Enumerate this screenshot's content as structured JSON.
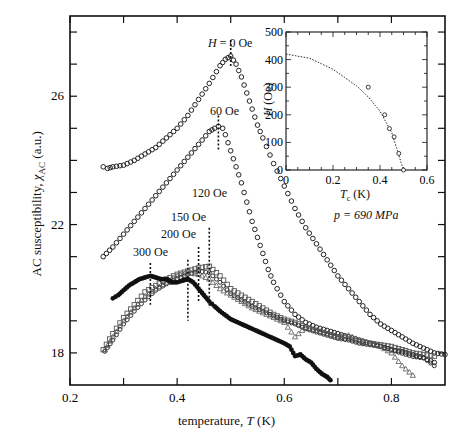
{
  "chart_data": [
    {
      "type": "scatter",
      "title": "",
      "xlabel": "temperature, T (K)",
      "ylabel": "AC susceptibility, χ_AC (a.u.)",
      "xlim": [
        0.2,
        0.9
      ],
      "ylim": [
        17.0,
        28.5
      ],
      "xticks": [
        0.2,
        0.4,
        0.6,
        0.8
      ],
      "xticks_minor": [
        0.3,
        0.5,
        0.7
      ],
      "yticks": [
        18,
        22,
        26
      ],
      "yticks_minor": [
        19,
        20,
        21,
        23,
        24,
        25,
        27,
        28
      ],
      "grid": false,
      "annotations": [
        {
          "text": "H = 0 Oe",
          "x": 0.5,
          "y": 27.25
        },
        {
          "text": "60 Oe",
          "x": 0.477,
          "y": 25.06
        },
        {
          "text": "120 Oe",
          "x": 0.46,
          "y": 20.6
        },
        {
          "text": "150 Oe",
          "x": 0.44,
          "y": 20.6
        },
        {
          "text": "200 Oe",
          "x": 0.42,
          "y": 20.5
        },
        {
          "text": "300 Oe",
          "x": 0.35,
          "y": 20.4
        }
      ],
      "series": [
        {
          "name": "H = 0 Oe",
          "marker": "open-circle",
          "x": [
            0.262,
            0.27,
            0.28,
            0.3,
            0.32,
            0.34,
            0.36,
            0.38,
            0.4,
            0.42,
            0.44,
            0.46,
            0.48,
            0.49,
            0.5,
            0.51,
            0.52,
            0.53,
            0.54,
            0.55,
            0.56,
            0.58,
            0.6,
            0.62,
            0.64,
            0.66,
            0.68,
            0.7,
            0.72,
            0.74,
            0.76,
            0.78,
            0.8,
            0.82,
            0.84,
            0.86,
            0.88,
            0.9
          ],
          "y": [
            23.8,
            23.75,
            23.8,
            23.85,
            24.0,
            24.2,
            24.4,
            24.7,
            25.0,
            25.4,
            25.9,
            26.4,
            26.95,
            27.15,
            27.25,
            27.0,
            26.6,
            26.1,
            25.6,
            25.1,
            24.7,
            23.9,
            23.2,
            22.5,
            21.9,
            21.4,
            20.9,
            20.4,
            20.0,
            19.6,
            19.2,
            18.9,
            18.7,
            18.5,
            18.3,
            18.15,
            18.0,
            17.95
          ]
        },
        {
          "name": "60 Oe",
          "marker": "open-circle",
          "x": [
            0.262,
            0.28,
            0.3,
            0.32,
            0.34,
            0.36,
            0.38,
            0.4,
            0.42,
            0.44,
            0.46,
            0.47,
            0.477,
            0.485,
            0.49,
            0.5,
            0.51,
            0.52,
            0.53,
            0.54,
            0.55,
            0.56,
            0.57,
            0.58,
            0.6,
            0.62,
            0.64,
            0.66,
            0.68,
            0.7,
            0.72,
            0.74,
            0.76,
            0.78,
            0.8,
            0.82,
            0.84,
            0.86,
            0.88
          ],
          "y": [
            21.0,
            21.3,
            21.7,
            22.1,
            22.5,
            22.9,
            23.3,
            23.7,
            24.1,
            24.5,
            24.9,
            25.0,
            25.06,
            25.0,
            24.8,
            24.3,
            23.8,
            23.3,
            22.7,
            22.1,
            21.6,
            21.1,
            20.6,
            20.2,
            19.6,
            19.2,
            18.95,
            18.8,
            18.7,
            18.6,
            18.5,
            18.4,
            18.3,
            18.2,
            18.1,
            18.0,
            17.9,
            17.85,
            17.7
          ]
        },
        {
          "name": "120 Oe",
          "marker": "open-square",
          "x": [
            0.262,
            0.28,
            0.3,
            0.32,
            0.34,
            0.36,
            0.38,
            0.4,
            0.42,
            0.44,
            0.46,
            0.48,
            0.5,
            0.52,
            0.54,
            0.56,
            0.58,
            0.6,
            0.62,
            0.64,
            0.66,
            0.68,
            0.7,
            0.72,
            0.74,
            0.76,
            0.78,
            0.8,
            0.82,
            0.84,
            0.86,
            0.88
          ],
          "y": [
            18.1,
            18.6,
            19.1,
            19.5,
            19.9,
            20.1,
            20.3,
            20.45,
            20.55,
            20.65,
            20.7,
            20.4,
            20.0,
            19.8,
            19.6,
            19.4,
            19.2,
            19.05,
            18.95,
            18.8,
            18.7,
            18.6,
            18.5,
            18.45,
            18.35,
            18.3,
            18.25,
            18.2,
            18.1,
            18.0,
            17.95,
            17.9
          ]
        },
        {
          "name": "150 Oe",
          "marker": "open-circle-small",
          "x": [
            0.265,
            0.28,
            0.3,
            0.32,
            0.34,
            0.36,
            0.38,
            0.4,
            0.42,
            0.44,
            0.46,
            0.48,
            0.5,
            0.52,
            0.54,
            0.56,
            0.58,
            0.6,
            0.62,
            0.64,
            0.66,
            0.68,
            0.7,
            0.72,
            0.74,
            0.76,
            0.78,
            0.8,
            0.82,
            0.84,
            0.86,
            0.88
          ],
          "y": [
            18.05,
            18.4,
            18.9,
            19.3,
            19.65,
            19.95,
            20.15,
            20.3,
            20.45,
            20.55,
            20.5,
            20.2,
            19.85,
            19.65,
            19.45,
            19.3,
            19.15,
            19.0,
            18.9,
            18.75,
            18.65,
            18.55,
            18.45,
            18.4,
            18.3,
            18.25,
            18.2,
            18.1,
            18.05,
            17.95,
            17.85,
            17.6
          ]
        },
        {
          "name": "200 Oe",
          "marker": "open-triangle",
          "x": [
            0.265,
            0.28,
            0.3,
            0.32,
            0.34,
            0.36,
            0.38,
            0.4,
            0.42,
            0.44,
            0.46,
            0.48,
            0.5,
            0.52,
            0.54,
            0.56,
            0.58,
            0.6,
            0.62,
            0.64,
            0.66,
            0.68,
            0.7,
            0.72,
            0.74,
            0.76,
            0.78,
            0.8,
            0.82,
            0.84
          ],
          "y": [
            18.1,
            18.5,
            19.0,
            19.4,
            19.75,
            20.0,
            20.2,
            20.4,
            20.5,
            20.45,
            20.3,
            20.0,
            19.8,
            19.6,
            19.4,
            19.25,
            19.1,
            18.95,
            18.5,
            18.8,
            18.7,
            18.6,
            18.5,
            18.55,
            18.4,
            18.3,
            18.2,
            18.0,
            17.6,
            17.3
          ]
        },
        {
          "name": "300 Oe",
          "marker": "filled-circle",
          "x": [
            0.28,
            0.29,
            0.3,
            0.31,
            0.32,
            0.33,
            0.34,
            0.35,
            0.36,
            0.37,
            0.38,
            0.39,
            0.4,
            0.41,
            0.42,
            0.43,
            0.44,
            0.45,
            0.46,
            0.47,
            0.48,
            0.5,
            0.52,
            0.54,
            0.56,
            0.58,
            0.6,
            0.61,
            0.62,
            0.63,
            0.64,
            0.65,
            0.66,
            0.67,
            0.68,
            0.686
          ],
          "y": [
            19.7,
            19.8,
            19.95,
            20.1,
            20.2,
            20.3,
            20.35,
            20.4,
            20.35,
            20.3,
            20.3,
            20.2,
            20.2,
            20.25,
            20.3,
            20.2,
            20.0,
            19.8,
            19.6,
            19.45,
            19.3,
            19.05,
            18.9,
            18.75,
            18.6,
            18.45,
            18.3,
            18.2,
            17.9,
            17.95,
            17.8,
            17.7,
            17.5,
            17.35,
            17.25,
            17.15
          ]
        }
      ]
    },
    {
      "type": "scatter",
      "title": "inset",
      "xlabel": "T_c (K)",
      "ylabel": "H (Oe)",
      "xlim": [
        0,
        0.6
      ],
      "ylim": [
        0,
        500
      ],
      "xticks": [
        0,
        0.2,
        0.4,
        0.6
      ],
      "yticks": [
        0,
        100,
        200,
        300,
        400,
        500
      ],
      "grid": false,
      "annotation": "p = 690 MPa",
      "series": [
        {
          "name": "data",
          "marker": "open-circle",
          "x": [
            0.35,
            0.42,
            0.44,
            0.46,
            0.48,
            0.5
          ],
          "y": [
            300,
            200,
            150,
            120,
            60,
            0
          ]
        },
        {
          "name": "fit",
          "style": "dotted-line",
          "x": [
            0,
            0.1,
            0.2,
            0.3,
            0.35,
            0.4,
            0.45,
            0.5
          ],
          "y": [
            420,
            405,
            365,
            305,
            265,
            213,
            135,
            0
          ]
        }
      ]
    }
  ],
  "labels": {
    "xlabel_main": "temperature, ",
    "xlabel_var": "T",
    "xlabel_unit": " (K)",
    "ylabel_main": "AC susceptibility, ",
    "ylabel_var": "χ",
    "ylabel_sub": "AC",
    "ylabel_unit": " (a.u.)",
    "inset_xlabel_var": "T",
    "inset_xlabel_sub": "c",
    "inset_xlabel_unit": " (K)",
    "inset_ylabel_var": "H",
    "inset_ylabel_unit": " (Oe)",
    "pressure": "p = 690 MPa",
    "h0_var": "H",
    "h0_rest": " = 0 Oe",
    "h60": "60 Oe",
    "h120": "120 Oe",
    "h150": "150 Oe",
    "h200": "200 Oe",
    "h300": "300 Oe"
  }
}
